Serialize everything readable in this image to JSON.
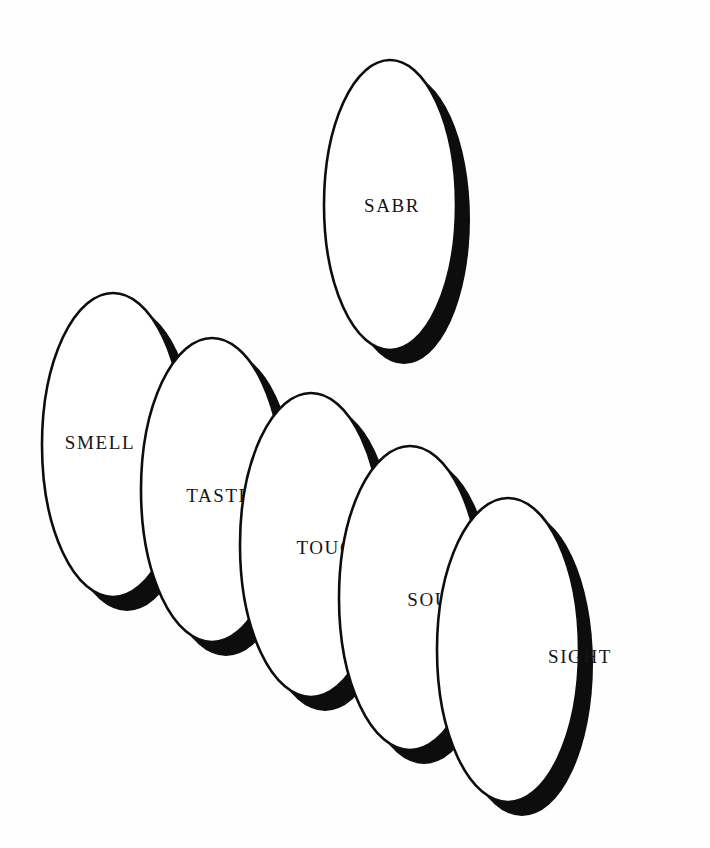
{
  "figure": {
    "background_color": "#fefefe",
    "ink_color": "#0d0d0d",
    "face_color": "#ffffff"
  },
  "diagram_data": {
    "type": "diagram",
    "shape": "ellipse",
    "style": "white ellipse with black outline and offset black drop shadow",
    "shadow_offset": {
      "dx": 14,
      "dy": 14
    },
    "nodes": [
      {
        "id": "smell",
        "label": "SMELL",
        "cx": 113,
        "cy": 445,
        "rx": 71,
        "ry": 152,
        "label_x": 100,
        "label_y": 445,
        "z": 1
      },
      {
        "id": "taste",
        "label": "TASTE",
        "cx": 212,
        "cy": 490,
        "rx": 71,
        "ry": 152,
        "label_x": 219,
        "label_y": 498,
        "z": 2
      },
      {
        "id": "touch",
        "label": "TOUCH",
        "cx": 311,
        "cy": 545,
        "rx": 71,
        "ry": 152,
        "label_x": 333,
        "label_y": 550,
        "z": 3
      },
      {
        "id": "sound",
        "label": "SOUND",
        "cx": 410,
        "cy": 598,
        "rx": 71,
        "ry": 152,
        "label_x": 444,
        "label_y": 602,
        "z": 4
      },
      {
        "id": "sight",
        "label": "SIGHT",
        "cx": 508,
        "cy": 650,
        "rx": 71,
        "ry": 152,
        "label_x": 580,
        "label_y": 659,
        "z": 5
      },
      {
        "id": "sabr",
        "label": "SABR",
        "cx": 390,
        "cy": 205,
        "rx": 66,
        "ry": 145,
        "label_x": 392,
        "label_y": 208,
        "z": 0
      }
    ]
  }
}
